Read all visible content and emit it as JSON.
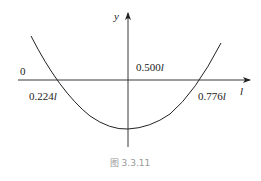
{
  "figure": {
    "caption": "图 3.3.11",
    "axes": {
      "x_label": "l",
      "y_label": "y",
      "origin_label": "0"
    },
    "annotations": {
      "left_root": "0.224",
      "left_root_unit": "l",
      "center": "0.500",
      "center_unit": "l",
      "right_root": "0.776",
      "right_root_unit": "l"
    },
    "curve": {
      "shape": "parabola-upward",
      "roots": [
        "0.224l",
        "0.776l"
      ],
      "vertex_at": "0.500l"
    },
    "colors": {
      "line": "#222222",
      "caption": "#999999"
    }
  }
}
